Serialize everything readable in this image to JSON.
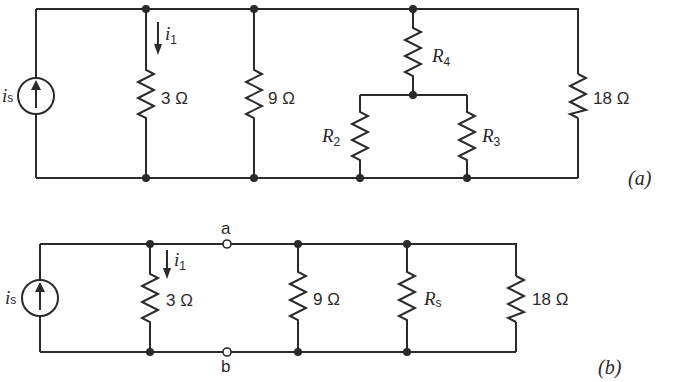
{
  "figure": {
    "circuit_a": {
      "caption": "(a)",
      "source": {
        "label": "i",
        "sub": "s"
      },
      "current": {
        "label": "i",
        "sub": "1"
      },
      "resistors": [
        {
          "id": "r3ohm",
          "label": "3 Ω"
        },
        {
          "id": "r9ohm",
          "label": "9 Ω"
        },
        {
          "id": "R4",
          "label": "R",
          "sub": "4"
        },
        {
          "id": "R2",
          "label": "R",
          "sub": "2"
        },
        {
          "id": "R3",
          "label": "R",
          "sub": "3"
        },
        {
          "id": "r18ohm",
          "label": "18 Ω"
        }
      ]
    },
    "circuit_b": {
      "caption": "(b)",
      "source": {
        "label": "i",
        "sub": "s"
      },
      "current": {
        "label": "i",
        "sub": "1"
      },
      "terminals": {
        "top": "a",
        "bottom": "b"
      },
      "resistors": [
        {
          "id": "r3ohm",
          "label": "3 Ω"
        },
        {
          "id": "r9ohm",
          "label": "9 Ω"
        },
        {
          "id": "Rs",
          "label": "R",
          "sub": "s"
        },
        {
          "id": "r18ohm",
          "label": "18 Ω"
        }
      ]
    }
  }
}
